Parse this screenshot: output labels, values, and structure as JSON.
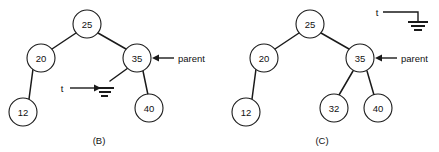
{
  "figure": {
    "panels": [
      {
        "id": "panel-b",
        "caption": "(B)",
        "caption_pos": {
          "x": 99,
          "y": 140
        },
        "nodes": [
          {
            "id": "b-25",
            "label": "25",
            "cx": 87,
            "cy": 24,
            "r": 14
          },
          {
            "id": "b-20",
            "label": "20",
            "cx": 41,
            "cy": 58,
            "r": 14
          },
          {
            "id": "b-35",
            "label": "35",
            "cx": 137,
            "cy": 58,
            "r": 14
          },
          {
            "id": "b-12",
            "label": "12",
            "cx": 23,
            "cy": 112,
            "r": 14
          },
          {
            "id": "b-40",
            "label": "40",
            "cx": 149,
            "cy": 108,
            "r": 14
          }
        ],
        "edges": [
          {
            "id": "b-edge-25-20",
            "x1": 76,
            "y1": 33,
            "x2": 52,
            "y2": 49
          },
          {
            "id": "b-edge-25-35",
            "x1": 98,
            "y1": 33,
            "x2": 126,
            "y2": 49
          },
          {
            "id": "b-edge-20-12",
            "x1": 33,
            "y1": 69,
            "x2": 29,
            "y2": 99
          },
          {
            "id": "b-edge-35-null",
            "x1": 128,
            "y1": 68,
            "x2": 110,
            "y2": 81
          },
          {
            "id": "b-edge-35-40",
            "x1": 143,
            "y1": 71,
            "x2": 148,
            "y2": 95
          }
        ],
        "ground": {
          "id": "b-ground",
          "x": 105,
          "y": 88,
          "bars": [
            {
              "w": 18,
              "y": 0
            },
            {
              "w": 12,
              "y": 4
            },
            {
              "w": 7,
              "y": 8
            }
          ]
        },
        "pointer": {
          "id": "b-pointer-t",
          "label": "t",
          "label_x": 62,
          "label_y": 88,
          "shaft_x1": 70,
          "shaft_x2": 99,
          "shaft_y": 88
        },
        "annotation": {
          "id": "b-annot-parent",
          "label": "parent",
          "label_x": 178,
          "label_y": 58,
          "shaft_x1": 174,
          "shaft_x2": 153,
          "shaft_y": 58
        }
      },
      {
        "id": "panel-c",
        "caption": "(C)",
        "caption_pos": {
          "x": 322,
          "y": 140
        },
        "nodes": [
          {
            "id": "c-25",
            "label": "25",
            "cx": 310,
            "cy": 24,
            "r": 14
          },
          {
            "id": "c-20",
            "label": "20",
            "cx": 264,
            "cy": 58,
            "r": 14
          },
          {
            "id": "c-35",
            "label": "35",
            "cx": 360,
            "cy": 58,
            "r": 14
          },
          {
            "id": "c-12",
            "label": "12",
            "cx": 246,
            "cy": 112,
            "r": 14
          },
          {
            "id": "c-32",
            "label": "32",
            "cx": 334,
            "cy": 108,
            "r": 14
          },
          {
            "id": "c-40",
            "label": "40",
            "cx": 378,
            "cy": 108,
            "r": 14
          }
        ],
        "edges": [
          {
            "id": "c-edge-25-20",
            "x1": 299,
            "y1": 33,
            "x2": 275,
            "y2": 49
          },
          {
            "id": "c-edge-25-35",
            "x1": 321,
            "y1": 33,
            "x2": 349,
            "y2": 49
          },
          {
            "id": "c-edge-20-12",
            "x1": 256,
            "y1": 69,
            "x2": 252,
            "y2": 99
          },
          {
            "id": "c-edge-35-32",
            "x1": 353,
            "y1": 71,
            "x2": 339,
            "y2": 95
          },
          {
            "id": "c-edge-35-40",
            "x1": 367,
            "y1": 71,
            "x2": 374,
            "y2": 95
          }
        ],
        "ground": {
          "id": "c-ground",
          "x": 418,
          "y": 22,
          "bars": [
            {
              "w": 20,
              "y": 0
            },
            {
              "w": 13,
              "y": 4
            },
            {
              "w": 7,
              "y": 8
            }
          ]
        },
        "pointer": {
          "id": "c-pointer-t",
          "label": "t",
          "label_x": 376,
          "label_y": 12,
          "elbow_x1": 383,
          "elbow_y": 12,
          "elbow_x2": 418,
          "elbow_y2": 22
        }
      }
    ]
  }
}
